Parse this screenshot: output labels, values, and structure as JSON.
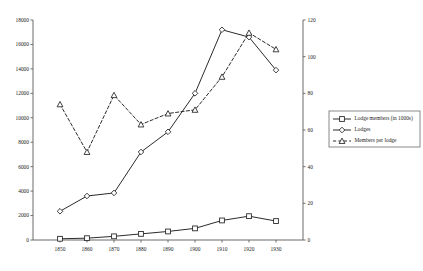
{
  "chart_data": {
    "type": "line",
    "title": "",
    "subtitle": "",
    "xlabel": "",
    "ylabel": "",
    "grid": false,
    "legend_position": "right-outside",
    "categories": [
      "1850",
      "1860",
      "1870",
      "1880",
      "1890",
      "1900",
      "1910",
      "1920",
      "1930"
    ],
    "x": [
      1850,
      1860,
      1870,
      1880,
      1890,
      1900,
      1910,
      1920,
      1930
    ],
    "axes": {
      "left": {
        "label": "",
        "ylim": [
          0,
          18000
        ],
        "ticks": [
          0,
          2000,
          4000,
          6000,
          8000,
          10000,
          12000,
          14000,
          16000,
          18000
        ],
        "tick_labels": [
          "0",
          "2000",
          "4000",
          "6000",
          "8000",
          "10000",
          "12000",
          "14000",
          "16000",
          "18000"
        ]
      },
      "right": {
        "label": "",
        "ylim": [
          0,
          120
        ],
        "ticks": [
          0,
          20,
          40,
          60,
          80,
          100,
          120
        ],
        "tick_labels": [
          "0",
          "20",
          "40",
          "60",
          "80",
          "100",
          "120"
        ]
      },
      "x": {
        "label": "",
        "tick_labels": [
          "1850",
          "1860",
          "1870",
          "1880",
          "1890",
          "1900",
          "1910",
          "1920",
          "1930"
        ]
      }
    },
    "series": [
      {
        "name": "Lodge members (in 1000s)",
        "axis": "left",
        "marker": "square",
        "line_style": "solid",
        "color": "#2b2b2b",
        "values": [
          100,
          150,
          300,
          500,
          700,
          950,
          1600,
          1950,
          1550
        ]
      },
      {
        "name": "Lodges",
        "axis": "left",
        "marker": "diamond",
        "line_style": "solid",
        "color": "#2b2b2b",
        "values": [
          2350,
          3600,
          3850,
          7200,
          8850,
          12000,
          17200,
          16600,
          13900
        ]
      },
      {
        "name": "Members per lodge",
        "axis": "right",
        "marker": "triangle",
        "line_style": "dashed",
        "color": "#2b2b2b",
        "values": [
          74,
          48,
          79,
          63,
          69,
          71,
          89,
          113,
          104
        ]
      }
    ]
  },
  "legend": {
    "items": [
      {
        "label": "Lodge members (in 1000s)",
        "marker": "square",
        "line_style": "solid"
      },
      {
        "label": "Lodges",
        "marker": "diamond",
        "line_style": "solid"
      },
      {
        "label": "Members per lodge",
        "marker": "triangle",
        "line_style": "dashed"
      }
    ]
  }
}
